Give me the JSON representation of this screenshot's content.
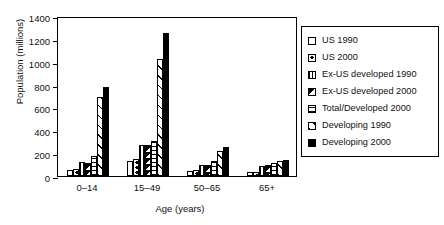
{
  "chart_data": {
    "type": "bar",
    "title": "",
    "xlabel": "Age (years)",
    "ylabel": "Population (millions)",
    "categories": [
      "0–14",
      "15–49",
      "50–65",
      "65+"
    ],
    "ylim": [
      0,
      1400
    ],
    "yticks": [
      0,
      200,
      400,
      600,
      800,
      1000,
      1200,
      1400
    ],
    "grid": false,
    "legend_position": "right-outside",
    "series": [
      {
        "name": "US 1990",
        "pattern": "white",
        "values": [
          54,
          132,
          42,
          31
        ]
      },
      {
        "name": "US 2000",
        "pattern": "dot",
        "values": [
          60,
          148,
          57,
          35
        ]
      },
      {
        "name": "Ex-US developed 1990",
        "pattern": "vertical-lines",
        "values": [
          122,
          270,
          96,
          85
        ]
      },
      {
        "name": "Ex-US developed 2000",
        "pattern": "half-black",
        "values": [
          115,
          268,
          98,
          96
        ]
      },
      {
        "name": "Total/Developed 2000",
        "pattern": "horizontal-lines",
        "values": [
          175,
          305,
          135,
          118
        ]
      },
      {
        "name": "Developing 1990",
        "pattern": "diagonal-hatch",
        "values": [
          690,
          1020,
          222,
          128
        ]
      },
      {
        "name": "Developing 2000",
        "pattern": "solid-black",
        "values": [
          775,
          1250,
          255,
          143
        ]
      }
    ]
  },
  "legend": {
    "items": [
      {
        "label": "US 1990"
      },
      {
        "label": "US 2000"
      },
      {
        "label": "Ex-US developed 1990"
      },
      {
        "label": "Ex-US developed 2000"
      },
      {
        "label": "Total/Developed 2000"
      },
      {
        "label": "Developing 1990"
      },
      {
        "label": "Developing 2000"
      }
    ]
  }
}
